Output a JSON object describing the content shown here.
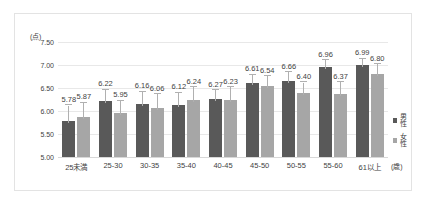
{
  "chart_data": {
    "type": "bar",
    "title": "",
    "xlabel": "(歳)",
    "ylabel": "(点)",
    "ylim": [
      5.0,
      7.5
    ],
    "yticks": [
      "5.00",
      "5.50",
      "6.00",
      "6.50",
      "7.00",
      "7.50"
    ],
    "ytick_values": [
      5.0,
      5.5,
      6.0,
      6.5,
      7.0,
      7.5
    ],
    "grid": true,
    "legend_position": "right",
    "categories": [
      "25未満",
      "25-30",
      "30-35",
      "35-40",
      "40-45",
      "45-50",
      "50-55",
      "55-60",
      "61以上"
    ],
    "series": [
      {
        "name": "男性",
        "color": "#595959",
        "values": [
          5.78,
          6.22,
          6.16,
          6.12,
          6.27,
          6.61,
          6.66,
          6.96,
          6.99
        ],
        "labels": [
          "5.78",
          "6.22",
          "6.16",
          "6.12",
          "6.27",
          "6.61",
          "6.66",
          "6.96",
          "6.99"
        ],
        "error_high": [
          6.12,
          6.46,
          6.42,
          6.4,
          6.45,
          6.79,
          6.84,
          7.1,
          7.14
        ]
      },
      {
        "name": "女性",
        "color": "#a6a6a6",
        "values": [
          5.87,
          5.95,
          6.06,
          6.24,
          6.23,
          6.54,
          6.4,
          6.37,
          6.8
        ],
        "labels": [
          "5.87",
          "5.95",
          "6.06",
          "6.24",
          "6.23",
          "6.54",
          "6.40",
          "6.37",
          "6.80"
        ],
        "error_high": [
          6.18,
          6.22,
          6.36,
          6.52,
          6.52,
          6.76,
          6.62,
          6.63,
          7.02
        ]
      }
    ]
  },
  "legend": {
    "items": [
      {
        "label": "男性",
        "color": "#595959"
      },
      {
        "label": "女性",
        "color": "#a6a6a6"
      }
    ]
  }
}
